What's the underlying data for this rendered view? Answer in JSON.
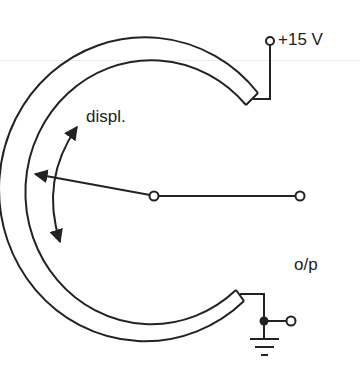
{
  "diagram": {
    "type": "potentiometric displacement sensor (arc potentiometer)",
    "labels": {
      "supply": "+15 V",
      "displacement": "displ.",
      "output": "o/p"
    },
    "colors": {
      "stroke": "#222222",
      "background": "#ffffff"
    },
    "components": [
      {
        "id": "resistive-track",
        "shape": "C-shaped arc track"
      },
      {
        "id": "wiper-arm",
        "from": "pivot",
        "to": "track contact"
      },
      {
        "id": "pivot-terminal",
        "shape": "open circle"
      },
      {
        "id": "output-terminal",
        "shape": "open circle"
      },
      {
        "id": "supply-terminal",
        "shape": "open circle"
      },
      {
        "id": "ground-node",
        "shape": "filled dot"
      },
      {
        "id": "ground-terminal",
        "shape": "open circle"
      },
      {
        "id": "ground-symbol",
        "shape": "earth"
      },
      {
        "id": "displacement-arrow",
        "shape": "curved double-headed arrow"
      }
    ]
  }
}
